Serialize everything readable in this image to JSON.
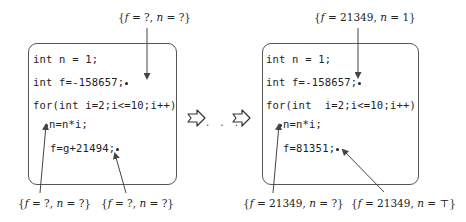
{
  "left_panel": {
    "code_lines": [
      "int n = 1;",
      "int f=-158657;",
      "for(int i=2;i<=10;i++)",
      "n=n*i;",
      "f=g+21494;"
    ],
    "annotations": {
      "top": {
        "f": "?",
        "n": "?"
      },
      "bottom_left": {
        "f": "?",
        "n": "?"
      },
      "bottom_right": {
        "f": "?",
        "n": "?"
      }
    }
  },
  "right_panel": {
    "code_lines": [
      "int n = 1;",
      "int f=-158657;",
      "for(int  i=2;i<=10;i++)",
      "n=n*i;",
      "f=81351;"
    ],
    "annotations": {
      "top": {
        "f": "21349",
        "n": "1"
      },
      "bottom_left": {
        "f": "21349",
        "n": "?"
      },
      "bottom_right": {
        "f": "21349",
        "n": "⊤"
      }
    }
  },
  "transition": {
    "arrow_icon": "hollow-right-arrow",
    "ellipsis": ". . ."
  }
}
